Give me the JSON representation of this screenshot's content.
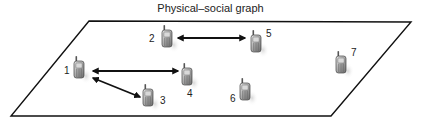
{
  "title": "Physical–social graph",
  "plane": {
    "corners": [
      [
        89,
        21
      ],
      [
        411,
        22
      ],
      [
        331,
        116
      ],
      [
        11,
        116
      ]
    ],
    "stroke": "#111111"
  },
  "nodes": [
    {
      "id": "1",
      "label": "1",
      "x": 73,
      "y": 56,
      "label_x": 64,
      "label_y": 74
    },
    {
      "id": "2",
      "label": "2",
      "x": 161,
      "y": 25,
      "label_x": 149,
      "label_y": 42
    },
    {
      "id": "3",
      "label": "3",
      "x": 142,
      "y": 84,
      "label_x": 160,
      "label_y": 104
    },
    {
      "id": "4",
      "label": "4",
      "x": 181,
      "y": 63,
      "label_x": 187,
      "label_y": 97
    },
    {
      "id": "5",
      "label": "5",
      "x": 250,
      "y": 30,
      "label_x": 266,
      "label_y": 37
    },
    {
      "id": "6",
      "label": "6",
      "x": 239,
      "y": 78,
      "label_x": 230,
      "label_y": 102
    },
    {
      "id": "7",
      "label": "7",
      "x": 335,
      "y": 51,
      "label_x": 351,
      "label_y": 56
    }
  ],
  "edges": [
    {
      "from": "2",
      "to": "5",
      "x1": 178,
      "y1": 38,
      "x2": 245,
      "y2": 38,
      "bidirectional": true
    },
    {
      "from": "1",
      "to": "4",
      "x1": 93,
      "y1": 71,
      "x2": 178,
      "y2": 71,
      "bidirectional": true
    },
    {
      "from": "1",
      "to": "3",
      "x1": 93,
      "y1": 78,
      "x2": 140,
      "y2": 97,
      "bidirectional": true
    }
  ],
  "node_icon": "mobile-phone-icon"
}
